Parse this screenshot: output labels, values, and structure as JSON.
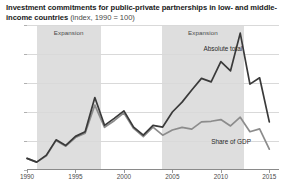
{
  "header": {
    "title_main": "Investment commitments for public-private partnerships in low- and middle-income countries ",
    "title_unit": "(index, 1990 = 100)"
  },
  "chart_data": {
    "type": "line",
    "title": "Investment commitments for public-private partnerships in low- and middle-income countries (index, 1990 = 100)",
    "xlabel": "",
    "ylabel": "",
    "xlim": [
      1990,
      2016
    ],
    "ylim": [
      0,
      1250
    ],
    "grid": true,
    "legend": "inline-annotations",
    "y_ticks": [
      "0",
      "250",
      "500",
      "750",
      "1,000",
      "1,250"
    ],
    "y_tick_values": [
      0,
      250,
      500,
      750,
      1000,
      1250
    ],
    "x_ticks": [
      "1990",
      "1995",
      "2000",
      "2005",
      "2010",
      "2015"
    ],
    "x_tick_values": [
      1990,
      1995,
      2000,
      2005,
      2010,
      2015
    ],
    "x": [
      1990,
      1991,
      1992,
      1993,
      1994,
      1995,
      1996,
      1997,
      1998,
      1999,
      2000,
      2001,
      2002,
      2003,
      2004,
      2005,
      2006,
      2007,
      2008,
      2009,
      2010,
      2011,
      2012,
      2013,
      2014,
      2015
    ],
    "series": [
      {
        "name": "Absolute total",
        "color": "#3a3a3a",
        "values": [
          100,
          68,
          128,
          260,
          212,
          290,
          330,
          625,
          385,
          445,
          510,
          370,
          300,
          385,
          370,
          500,
          585,
          690,
          790,
          760,
          935,
          855,
          1180,
          740,
          795,
          415
        ]
      },
      {
        "name": "Share of GDP",
        "color": "#8c8c8c",
        "values": [
          100,
          68,
          122,
          255,
          205,
          280,
          318,
          560,
          368,
          425,
          492,
          358,
          288,
          370,
          300,
          345,
          368,
          352,
          415,
          420,
          435,
          380,
          455,
          330,
          355,
          180
        ]
      }
    ],
    "bands": [
      {
        "label": "Expansion",
        "start": 1991,
        "end": 1997.6
      },
      {
        "label": "Expansion",
        "start": 2003.9,
        "end": 2012.4
      }
    ],
    "annotations": [
      {
        "text": "Absolute total",
        "x": 2008.2,
        "y": 1040
      },
      {
        "text": "Share of GDP",
        "x": 2009.0,
        "y": 245
      }
    ]
  }
}
